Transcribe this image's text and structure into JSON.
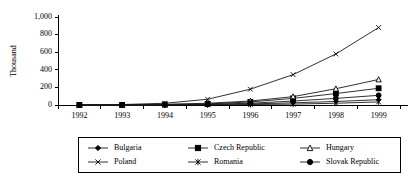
{
  "chart_data": {
    "type": "line",
    "title": "",
    "xlabel": "",
    "ylabel": "Thousand",
    "x": [
      "1992",
      "1993",
      "1994",
      "1995",
      "1996",
      "1997",
      "1998",
      "1999"
    ],
    "ylim": [
      0,
      1000
    ],
    "yticks": [
      "0",
      "200",
      "400",
      "600",
      "800",
      "1,000"
    ],
    "ytick_values": [
      0,
      200,
      400,
      600,
      800,
      1000
    ],
    "grid": false,
    "legend_position": "bottom",
    "series": [
      {
        "name": "Bulgaria",
        "marker": "diamond",
        "values": [
          0,
          0,
          2,
          5,
          12,
          25,
          40,
          60
        ]
      },
      {
        "name": "Czech Republic",
        "marker": "square",
        "values": [
          0,
          0,
          5,
          12,
          35,
          75,
          130,
          190
        ]
      },
      {
        "name": "Hungary",
        "marker": "triangle",
        "values": [
          0,
          0,
          8,
          20,
          45,
          95,
          185,
          290
        ]
      },
      {
        "name": "Poland",
        "marker": "cross-x",
        "values": [
          2,
          5,
          20,
          65,
          180,
          345,
          580,
          880
        ]
      },
      {
        "name": "Romania",
        "marker": "asterisk",
        "values": [
          0,
          0,
          1,
          2,
          5,
          10,
          20,
          35
        ]
      },
      {
        "name": "Slovak Republic",
        "marker": "circle",
        "values": [
          0,
          0,
          3,
          8,
          20,
          45,
          75,
          110
        ]
      }
    ]
  },
  "legend": {
    "entries": [
      {
        "label": "Bulgaria"
      },
      {
        "label": "Czech Republic"
      },
      {
        "label": "Hungary"
      },
      {
        "label": "Poland"
      },
      {
        "label": "Romania"
      },
      {
        "label": "Slovak Republic"
      }
    ]
  },
  "colors": {
    "line": "#1a1a1a",
    "axis": "#000000",
    "background": "#ffffff"
  }
}
